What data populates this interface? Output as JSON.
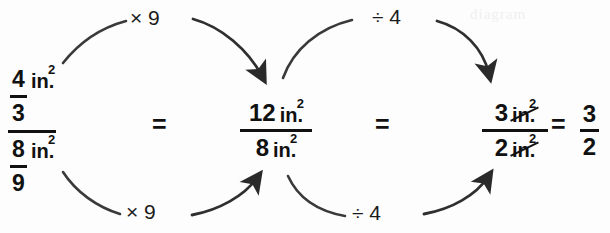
{
  "diagram": {
    "background_color": "#fdfdfd",
    "ink_color": "#111111",
    "ghost_text": "diagram"
  },
  "expressions": {
    "left_complex_fraction": {
      "numerator": {
        "fraction_numerator": "4",
        "fraction_denominator": "3",
        "unit": "in.",
        "unit_exponent": "2"
      },
      "denominator": {
        "fraction_numerator": "8",
        "fraction_denominator": "9",
        "unit": "in.",
        "unit_exponent": "2"
      }
    },
    "middle_fraction": {
      "numerator_value": "12",
      "numerator_unit": "in.",
      "numerator_unit_exponent": "2",
      "denominator_value": "8",
      "denominator_unit": "in.",
      "denominator_unit_exponent": "2"
    },
    "third_fraction": {
      "numerator_value": "3",
      "numerator_unit": "in.",
      "numerator_unit_exponent": "2",
      "numerator_unit_cancelled": true,
      "denominator_value": "2",
      "denominator_unit": "in.",
      "denominator_unit_exponent": "2",
      "denominator_unit_cancelled": true
    },
    "result_fraction": {
      "numerator": "3",
      "denominator": "2"
    }
  },
  "equals_signs": {
    "first": "=",
    "second": "=",
    "third": "="
  },
  "arrow_labels": {
    "top_left": "× 9",
    "bottom_left": "× 9",
    "top_right": "÷ 4",
    "bottom_right": "÷ 4"
  },
  "arrows": [
    {
      "name": "top-left-tail",
      "from": "left-numerator",
      "label": "× 9",
      "has_arrowhead": false
    },
    {
      "name": "top-left-head",
      "to": "middle-numerator",
      "label": "× 9",
      "has_arrowhead": true
    },
    {
      "name": "bottom-left-tail",
      "from": "left-denominator",
      "label": "× 9",
      "has_arrowhead": false
    },
    {
      "name": "bottom-left-head",
      "to": "middle-denominator",
      "label": "× 9",
      "has_arrowhead": true
    },
    {
      "name": "top-right-tail",
      "from": "middle-numerator",
      "label": "÷ 4",
      "has_arrowhead": false
    },
    {
      "name": "top-right-head",
      "to": "third-numerator",
      "label": "÷ 4",
      "has_arrowhead": true
    },
    {
      "name": "bottom-right-tail",
      "from": "middle-denominator",
      "label": "÷ 4",
      "has_arrowhead": false
    },
    {
      "name": "bottom-right-head",
      "to": "third-denominator",
      "label": "÷ 4",
      "has_arrowhead": true
    }
  ]
}
